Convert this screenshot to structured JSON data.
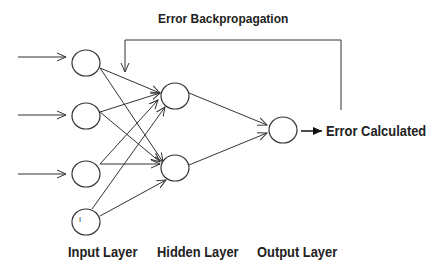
{
  "title": "Error Backpropagation",
  "output_label": "Error Calculated",
  "layers": [
    {
      "name": "Input Layer",
      "nodes": 4
    },
    {
      "name": "Hidden Layer",
      "nodes": 2
    },
    {
      "name": "Output Layer",
      "nodes": 1
    }
  ],
  "bias_node_label": "I",
  "colors": {
    "line": "#333333",
    "text": "#222222",
    "background": "#ffffff"
  }
}
